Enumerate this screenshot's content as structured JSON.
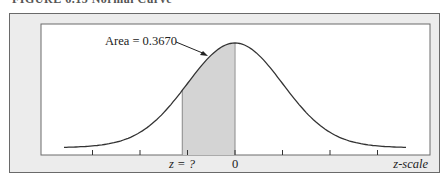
{
  "figure": {
    "caption": "FIGURE 6.15 Normal Curve",
    "frame_color": "#ececec",
    "shade_color": "#d4d4d4",
    "curve_color": "#333333"
  },
  "chart_data": {
    "type": "area",
    "title": "Normal Curve",
    "xlabel": "z-scale",
    "ylabel": "",
    "distribution": "standard normal",
    "x_range": [
      -3.6,
      3.6
    ],
    "tick_positions": [
      -3,
      -2,
      -1,
      0,
      1,
      2,
      3
    ],
    "tick_labels": [
      {
        "z": -1.11,
        "label": "z = ?"
      },
      {
        "z": 0,
        "label": "0"
      }
    ],
    "shaded_region": {
      "from_z": -1.11,
      "to_z": 0,
      "area": 0.367
    },
    "annotation": "Area = 0.3670",
    "grid": false,
    "legend": "none"
  }
}
